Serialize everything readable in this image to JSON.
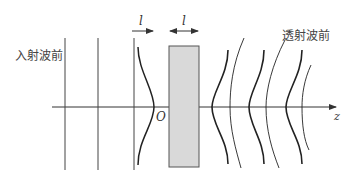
{
  "diagram": {
    "title": "",
    "labels": {
      "incident_wavefront": "入射波前",
      "transmitted_wavefront": "透射波前",
      "origin": "O",
      "axis": "z",
      "arrow_left_label": "l",
      "slab_width_label": "l"
    },
    "colors": {
      "line": "#333333",
      "slab_fill": "#d9d9d9",
      "slab_stroke": "#555555",
      "background": "#ffffff"
    },
    "elements": {
      "incident_plane_wavefronts": 3,
      "converging_wavefront_before_slab": 1,
      "slab": 1,
      "transmitted_wavefront_pairs": 3
    }
  }
}
